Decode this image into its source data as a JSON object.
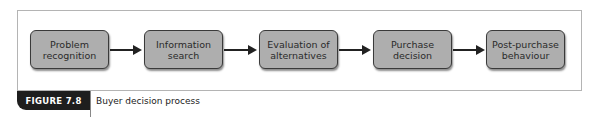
{
  "figure": {
    "label": "FIGURE 7.8",
    "caption": "Buyer decision process"
  },
  "steps": [
    {
      "line1": "Problem",
      "line2": "recognition"
    },
    {
      "line1": "Information",
      "line2": "search"
    },
    {
      "line1": "Evaluation of",
      "line2": "alternatives"
    },
    {
      "line1": "Purchase",
      "line2": "decision"
    },
    {
      "line1": "Post-purchase",
      "line2": "behaviour"
    }
  ],
  "colors": {
    "box_fill": "#aeaeae",
    "box_border": "#3a3a3a",
    "arrow": "#222222",
    "tab_bg": "#1e1e1e"
  }
}
